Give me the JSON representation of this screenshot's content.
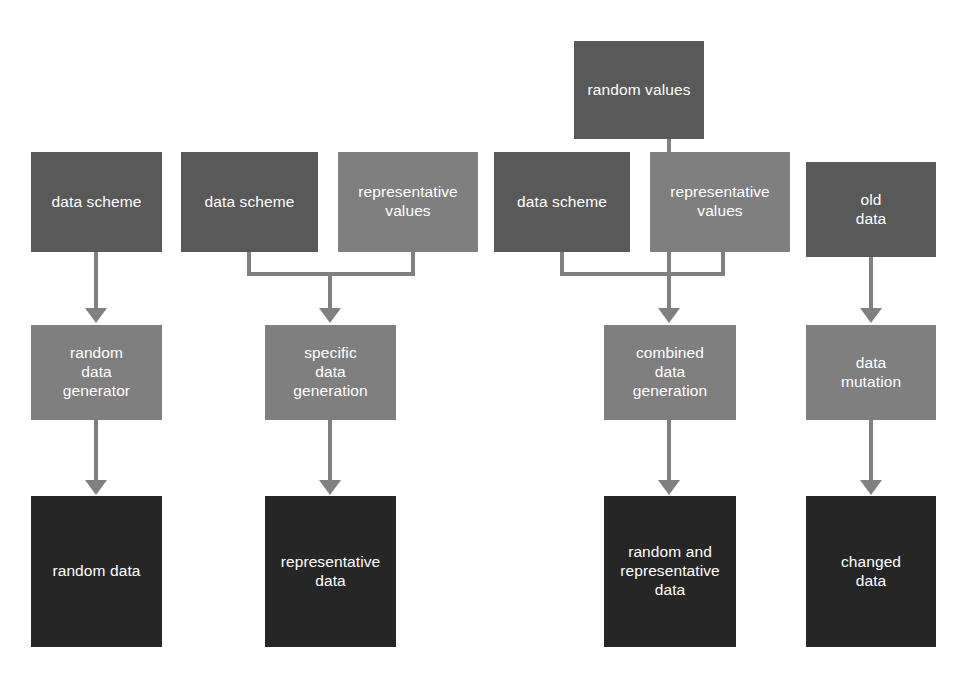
{
  "diagram": {
    "type": "flowchart",
    "background_color": "#ffffff",
    "palette": {
      "input_box": "#595959",
      "process_box": "#7f7f7f",
      "output_box": "#262626",
      "connector": "#808080",
      "label_text": "#ffffff"
    },
    "nodes": [
      {
        "id": "n1",
        "label": "data scheme",
        "tone": "dark",
        "column": 1,
        "row": "input"
      },
      {
        "id": "n2",
        "label": "random\ndata\ngenerator",
        "tone": "mid",
        "column": 1,
        "row": "process"
      },
      {
        "id": "n3",
        "label": "random data",
        "tone": "black",
        "column": 1,
        "row": "output"
      },
      {
        "id": "n4",
        "label": "data scheme",
        "tone": "dark",
        "column": 2,
        "row": "input"
      },
      {
        "id": "n5",
        "label": "representative\nvalues",
        "tone": "mid",
        "column": 2,
        "row": "input"
      },
      {
        "id": "n6",
        "label": "specific\ndata\ngeneration",
        "tone": "mid",
        "column": 2,
        "row": "process"
      },
      {
        "id": "n7",
        "label": "representative\ndata",
        "tone": "black",
        "column": 2,
        "row": "output"
      },
      {
        "id": "n8",
        "label": "random values",
        "tone": "dark",
        "column": 3,
        "row": "source"
      },
      {
        "id": "n9",
        "label": "data scheme",
        "tone": "dark",
        "column": 3,
        "row": "input"
      },
      {
        "id": "n10",
        "label": "representative\nvalues",
        "tone": "mid",
        "column": 3,
        "row": "input"
      },
      {
        "id": "n11",
        "label": "combined\ndata\ngeneration",
        "tone": "mid",
        "column": 3,
        "row": "process"
      },
      {
        "id": "n12",
        "label": "random and\nrepresentative\ndata",
        "tone": "black",
        "column": 3,
        "row": "output"
      },
      {
        "id": "n13",
        "label": "old\ndata",
        "tone": "dark",
        "column": 4,
        "row": "input"
      },
      {
        "id": "n14",
        "label": "data\nmutation",
        "tone": "mid",
        "column": 4,
        "row": "process"
      },
      {
        "id": "n15",
        "label": "changed\ndata",
        "tone": "black",
        "column": 4,
        "row": "output"
      }
    ],
    "edges": [
      {
        "from": "n1",
        "to": "n2",
        "style": "straight-arrow"
      },
      {
        "from": "n2",
        "to": "n3",
        "style": "straight-arrow"
      },
      {
        "from": "n4",
        "to": "n6",
        "style": "elbow-merge-arrow"
      },
      {
        "from": "n5",
        "to": "n6",
        "style": "elbow-merge-arrow"
      },
      {
        "from": "n6",
        "to": "n7",
        "style": "straight-arrow"
      },
      {
        "from": "n8",
        "to": "n11",
        "style": "straight-arrow"
      },
      {
        "from": "n9",
        "to": "n11",
        "style": "elbow-merge-arrow"
      },
      {
        "from": "n10",
        "to": "n11",
        "style": "elbow-merge-arrow"
      },
      {
        "from": "n11",
        "to": "n12",
        "style": "straight-arrow"
      },
      {
        "from": "n13",
        "to": "n14",
        "style": "straight-arrow"
      },
      {
        "from": "n14",
        "to": "n15",
        "style": "straight-arrow"
      }
    ]
  }
}
